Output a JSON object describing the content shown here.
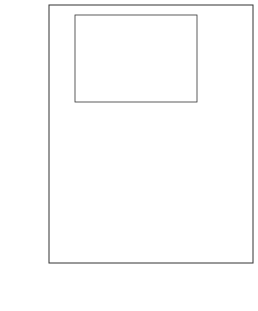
{
  "chart_data": [
    {
      "id": "main",
      "type": "line",
      "title": "",
      "xlabel": "E / V vs. SCE",
      "xlabel_italic": "E",
      "xlabel_rest": " / V vs. SCE",
      "ylabel": "σM / μC cm−2",
      "ylabel_parts": {
        "sigma": "σ",
        "sub": "M",
        "rest": " / μC cm",
        "sup": "−2"
      },
      "xlim": [
        -0.71,
        0.5
      ],
      "ylim": [
        -30,
        53
      ],
      "xticks": [
        -0.6,
        -0.4,
        -0.2,
        0.0,
        0.2,
        0.4
      ],
      "xtick_labels": [
        "-0.6",
        "-0.4",
        "-0.2",
        "0.0",
        "0.2",
        "0.4"
      ],
      "yticks": [
        -20,
        0,
        20,
        40
      ],
      "ytick_labels": [
        "-20",
        "0",
        "20",
        "40"
      ],
      "grid": false,
      "legend": null,
      "series": [
        {
          "name": "solid",
          "style": "solid",
          "x": [
            -0.63,
            -0.6,
            -0.55,
            -0.5,
            -0.45,
            -0.4,
            -0.35,
            -0.3,
            -0.25,
            -0.2,
            -0.15,
            -0.1,
            -0.05,
            0.0,
            0.05,
            0.08,
            0.1,
            0.15,
            0.2,
            0.25,
            0.3,
            0.35,
            0.4,
            0.45,
            0.5
          ],
          "y": [
            -24.0,
            -23.4,
            -22.2,
            -20.6,
            -18.8,
            -17.0,
            -15.0,
            -12.8,
            -10.6,
            -8.4,
            -6.2,
            -4.0,
            -1.8,
            0.4,
            2.8,
            5.0,
            7.0,
            13.0,
            19.5,
            26.0,
            32.0,
            37.5,
            42.5,
            46.8,
            50.0
          ]
        },
        {
          "name": "dashed",
          "style": "dashed",
          "x": [
            -0.71,
            -0.66,
            -0.62,
            -0.58,
            -0.55,
            -0.52,
            -0.49,
            -0.46,
            -0.44,
            -0.42,
            -0.4,
            -0.37,
            -0.33,
            -0.28,
            -0.2,
            -0.1,
            0.0,
            0.1,
            0.2,
            0.25,
            0.3,
            0.4,
            0.5
          ],
          "y": [
            -26.5,
            -25.0,
            -23.0,
            -20.0,
            -16.0,
            -11.0,
            -4.0,
            3.0,
            7.5,
            10.0,
            11.5,
            12.5,
            13.2,
            13.8,
            15.0,
            16.3,
            17.8,
            19.8,
            22.8,
            24.8,
            26.8,
            30.8,
            35.0
          ]
        }
      ]
    },
    {
      "id": "inset",
      "type": "line",
      "title": "",
      "xlabel": "E / V vs. SCE",
      "xlabel_italic": "E",
      "xlabel_rest": " / V vs. SCE",
      "ylabel": "10^10 Γ / mol cm−2",
      "ylabel_parts": {
        "base": "10",
        "exp": "10",
        "gamma": " Γ",
        "rest": " / mol cm",
        "sup": "−2"
      },
      "xlim": [
        -0.88,
        0.46
      ],
      "ylim": [
        -0.3,
        7.3
      ],
      "xticks": [
        -0.8,
        -0.6,
        -0.4,
        -0.2,
        0.0,
        0.2,
        0.4
      ],
      "xtick_labels": [
        "-0.8",
        "-0.6",
        "-0.4",
        "-0.2",
        "0.0",
        "0.2",
        "0.4"
      ],
      "yticks": [
        0,
        1,
        2,
        3,
        4,
        5,
        6,
        7
      ],
      "ytick_labels": [
        "0",
        "1",
        "2",
        "3",
        "4",
        "5",
        "6",
        "7"
      ],
      "grid": false,
      "series": [
        {
          "name": "surface excess",
          "style": "solid",
          "x": [
            -0.8,
            -0.75,
            -0.7,
            -0.65,
            -0.6,
            -0.55,
            -0.5,
            -0.47,
            -0.45,
            -0.43,
            -0.41,
            -0.4,
            -0.38,
            -0.3,
            -0.2,
            0.0,
            0.2,
            0.38
          ],
          "y": [
            0.1,
            0.4,
            0.8,
            1.3,
            2.0,
            2.9,
            4.0,
            4.8,
            5.4,
            5.8,
            6.05,
            6.1,
            6.1,
            6.1,
            6.1,
            6.1,
            6.1,
            6.1
          ]
        }
      ]
    }
  ]
}
